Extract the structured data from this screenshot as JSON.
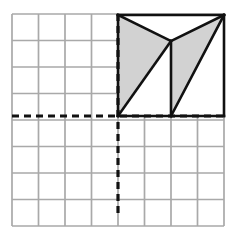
{
  "figure": {
    "canvas": {
      "width": 237,
      "height": 235,
      "background": "#ffffff"
    },
    "grid": {
      "name": "square-grid",
      "columns": 8,
      "rows": 8,
      "x0": 12,
      "y0": 14,
      "cell": 26.5,
      "line_color": "#a9a9a9",
      "line_width": 1.7,
      "visible": true
    },
    "axes": {
      "style": "dashed",
      "color": "#111111",
      "line_width": 3.2,
      "dash_pattern": "7,5",
      "vertical": {
        "name": "y-axis",
        "x": 118,
        "y_start": 14,
        "y_end": 218,
        "grid_column": 4
      },
      "horizontal": {
        "name": "x-axis",
        "y": 116,
        "x_start": 12,
        "x_end": 224,
        "grid_row": 4
      }
    },
    "shape": {
      "name": "shaded-polygon-figure",
      "outline_color": "#111111",
      "outline_width": 2.6,
      "fill_shaded": "#d2d2d2",
      "fill_unshaded": "#ffffff",
      "bounding_box": {
        "left": 118,
        "top": 15,
        "right": 224,
        "bottom": 116
      },
      "vertices": {
        "top_left": [
          118,
          15
        ],
        "top_right": [
          224,
          15
        ],
        "bottom_left": [
          118,
          116
        ],
        "bottom_right": [
          224,
          116
        ],
        "apex_center": [
          171,
          41
        ],
        "bottom_center": [
          171,
          116
        ]
      },
      "shaded_regions": [
        {
          "name": "left-shaded-band",
          "points": "118,15 171,41 171,116 118,116"
        },
        {
          "name": "right-shaded-band",
          "points": "171,41 224,15 224,116 171,116"
        }
      ],
      "unshaded_regions": [
        {
          "name": "center-notch-triangle",
          "points": "118,15 224,15 171,41"
        },
        {
          "name": "left-lower-triangle",
          "points": "118,116 171,41 171,116"
        },
        {
          "name": "right-lower-triangle",
          "points": "171,116 224,15 224,116"
        }
      ],
      "segments": [
        {
          "name": "top-edge",
          "from": [
            118,
            15
          ],
          "to": [
            224,
            15
          ]
        },
        {
          "name": "bottom-edge",
          "from": [
            118,
            116
          ],
          "to": [
            224,
            116
          ]
        },
        {
          "name": "left-edge",
          "from": [
            118,
            15
          ],
          "to": [
            118,
            116
          ]
        },
        {
          "name": "right-edge",
          "from": [
            224,
            15
          ],
          "to": [
            224,
            116
          ]
        },
        {
          "name": "notch-left-diagonal",
          "from": [
            118,
            15
          ],
          "to": [
            171,
            41
          ]
        },
        {
          "name": "notch-right-diagonal",
          "from": [
            224,
            15
          ],
          "to": [
            171,
            41
          ]
        },
        {
          "name": "center-vertical",
          "from": [
            171,
            41
          ],
          "to": [
            171,
            116
          ]
        },
        {
          "name": "left-rising-diagonal",
          "from": [
            118,
            116
          ],
          "to": [
            171,
            41
          ]
        },
        {
          "name": "right-rising-diagonal",
          "from": [
            171,
            116
          ],
          "to": [
            224,
            15
          ]
        }
      ]
    }
  }
}
